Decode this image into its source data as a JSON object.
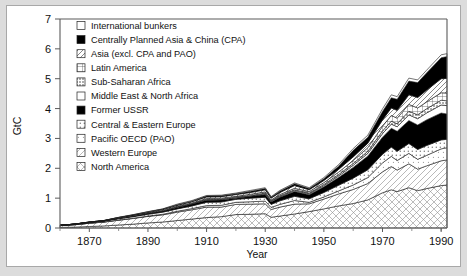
{
  "figure": {
    "background": "#dcdcdc",
    "panel_background": "#ffffff",
    "panel_border": "#a8a8a8"
  },
  "chart_data": {
    "type": "area",
    "stacked": true,
    "title": "",
    "xlabel": "Year",
    "ylabel": "GtC",
    "xlim": [
      1860,
      1992
    ],
    "ylim": [
      0,
      7
    ],
    "xticks": [
      1870,
      1890,
      1910,
      1930,
      1950,
      1970,
      1990
    ],
    "xticks_minor": [
      1860,
      1880,
      1900,
      1920,
      1940,
      1960,
      1980,
      1990
    ],
    "yticks": [
      0,
      1,
      2,
      3,
      4,
      5,
      6,
      7
    ],
    "grid": false,
    "legend_position": "top-left",
    "x": [
      1860,
      1865,
      1870,
      1875,
      1880,
      1885,
      1890,
      1895,
      1900,
      1905,
      1910,
      1915,
      1920,
      1925,
      1930,
      1932,
      1935,
      1940,
      1945,
      1950,
      1955,
      1960,
      1965,
      1970,
      1973,
      1975,
      1979,
      1982,
      1985,
      1990,
      1992
    ],
    "series": [
      {
        "name": "North America",
        "pattern": "cross-hatch-light",
        "values": [
          0.02,
          0.03,
          0.05,
          0.07,
          0.1,
          0.13,
          0.17,
          0.2,
          0.25,
          0.3,
          0.35,
          0.38,
          0.45,
          0.46,
          0.48,
          0.36,
          0.4,
          0.47,
          0.55,
          0.64,
          0.74,
          0.82,
          0.94,
          1.18,
          1.28,
          1.22,
          1.35,
          1.25,
          1.32,
          1.42,
          1.44
        ]
      },
      {
        "name": "Western Europe",
        "pattern": "cross-hatch-fine",
        "values": [
          0.06,
          0.08,
          0.11,
          0.13,
          0.16,
          0.19,
          0.22,
          0.24,
          0.28,
          0.31,
          0.35,
          0.32,
          0.34,
          0.34,
          0.33,
          0.26,
          0.3,
          0.33,
          0.26,
          0.33,
          0.4,
          0.47,
          0.55,
          0.7,
          0.78,
          0.72,
          0.8,
          0.72,
          0.76,
          0.83,
          0.84
        ]
      },
      {
        "name": "Pacific OECD (PAO)",
        "pattern": "dots-light",
        "values": [
          0.0,
          0.0,
          0.0,
          0.0,
          0.01,
          0.01,
          0.01,
          0.02,
          0.03,
          0.04,
          0.05,
          0.06,
          0.07,
          0.08,
          0.09,
          0.07,
          0.09,
          0.12,
          0.05,
          0.07,
          0.1,
          0.15,
          0.2,
          0.3,
          0.34,
          0.32,
          0.35,
          0.33,
          0.35,
          0.4,
          0.41
        ]
      },
      {
        "name": "Central & Eastern Europe",
        "pattern": "dots-gray",
        "values": [
          0.01,
          0.01,
          0.02,
          0.03,
          0.04,
          0.05,
          0.06,
          0.07,
          0.08,
          0.09,
          0.11,
          0.11,
          0.1,
          0.12,
          0.13,
          0.1,
          0.12,
          0.14,
          0.12,
          0.15,
          0.19,
          0.23,
          0.26,
          0.29,
          0.31,
          0.31,
          0.33,
          0.33,
          0.33,
          0.3,
          0.28
        ]
      },
      {
        "name": "Former USSR",
        "pattern": "solid-black",
        "values": [
          0.0,
          0.01,
          0.01,
          0.01,
          0.02,
          0.02,
          0.03,
          0.04,
          0.05,
          0.06,
          0.07,
          0.07,
          0.04,
          0.06,
          0.09,
          0.08,
          0.12,
          0.16,
          0.13,
          0.19,
          0.26,
          0.36,
          0.46,
          0.57,
          0.63,
          0.67,
          0.77,
          0.82,
          0.86,
          0.9,
          0.85
        ]
      },
      {
        "name": "Middle East & North Africa",
        "pattern": "white",
        "values": [
          0.0,
          0.0,
          0.0,
          0.0,
          0.0,
          0.0,
          0.0,
          0.0,
          0.01,
          0.01,
          0.01,
          0.01,
          0.01,
          0.01,
          0.02,
          0.02,
          0.02,
          0.03,
          0.03,
          0.04,
          0.05,
          0.07,
          0.09,
          0.12,
          0.14,
          0.15,
          0.19,
          0.21,
          0.23,
          0.27,
          0.28
        ]
      },
      {
        "name": "Sub-Saharan Africa",
        "pattern": "dots-dense",
        "values": [
          0.0,
          0.0,
          0.0,
          0.0,
          0.0,
          0.0,
          0.01,
          0.01,
          0.01,
          0.01,
          0.02,
          0.02,
          0.02,
          0.02,
          0.03,
          0.02,
          0.03,
          0.03,
          0.03,
          0.04,
          0.05,
          0.06,
          0.07,
          0.09,
          0.1,
          0.1,
          0.12,
          0.13,
          0.14,
          0.16,
          0.16
        ]
      },
      {
        "name": "Latin America",
        "pattern": "grid",
        "values": [
          0.0,
          0.0,
          0.0,
          0.0,
          0.01,
          0.01,
          0.01,
          0.01,
          0.02,
          0.02,
          0.03,
          0.03,
          0.03,
          0.04,
          0.04,
          0.03,
          0.04,
          0.05,
          0.05,
          0.06,
          0.08,
          0.1,
          0.12,
          0.16,
          0.19,
          0.19,
          0.23,
          0.23,
          0.23,
          0.25,
          0.26
        ]
      },
      {
        "name": "Asia (excl. CPA and PAO)",
        "pattern": "diag-light",
        "values": [
          0.0,
          0.0,
          0.01,
          0.01,
          0.01,
          0.02,
          0.02,
          0.03,
          0.03,
          0.04,
          0.05,
          0.05,
          0.06,
          0.06,
          0.07,
          0.06,
          0.07,
          0.09,
          0.06,
          0.07,
          0.09,
          0.12,
          0.15,
          0.21,
          0.25,
          0.26,
          0.32,
          0.35,
          0.39,
          0.47,
          0.49
        ]
      },
      {
        "name": "Centrally Planned Asia & China (CPA)",
        "pattern": "solid-black",
        "values": [
          0.0,
          0.0,
          0.0,
          0.0,
          0.0,
          0.01,
          0.01,
          0.01,
          0.02,
          0.02,
          0.03,
          0.03,
          0.03,
          0.04,
          0.04,
          0.03,
          0.04,
          0.06,
          0.04,
          0.06,
          0.11,
          0.22,
          0.2,
          0.28,
          0.34,
          0.37,
          0.46,
          0.5,
          0.58,
          0.7,
          0.73
        ]
      },
      {
        "name": "International bunkers",
        "pattern": "white",
        "values": [
          0.0,
          0.0,
          0.0,
          0.0,
          0.01,
          0.01,
          0.01,
          0.01,
          0.02,
          0.02,
          0.02,
          0.02,
          0.02,
          0.03,
          0.03,
          0.02,
          0.03,
          0.03,
          0.03,
          0.04,
          0.05,
          0.06,
          0.07,
          0.09,
          0.1,
          0.09,
          0.1,
          0.09,
          0.09,
          0.1,
          0.1
        ]
      }
    ]
  },
  "legend": {
    "items": [
      {
        "label": "International bunkers",
        "pattern": "white"
      },
      {
        "label": "Centrally Planned Asia & China (CPA)",
        "pattern": "solid-black"
      },
      {
        "label": "Asia (excl. CPA and PAO)",
        "pattern": "diag-light"
      },
      {
        "label": "Latin America",
        "pattern": "grid"
      },
      {
        "label": "Sub-Saharan Africa",
        "pattern": "dots-dense"
      },
      {
        "label": "Middle East & North Africa",
        "pattern": "white"
      },
      {
        "label": "Former USSR",
        "pattern": "solid-black"
      },
      {
        "label": "Central & Eastern Europe",
        "pattern": "dots-gray"
      },
      {
        "label": "Pacific OECD (PAO)",
        "pattern": "dots-light"
      },
      {
        "label": "Western Europe",
        "pattern": "cross-hatch-fine"
      },
      {
        "label": "North America",
        "pattern": "cross-hatch-light"
      }
    ]
  }
}
